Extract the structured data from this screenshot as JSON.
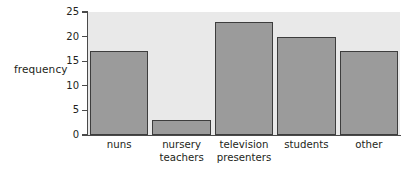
{
  "chart_data": {
    "type": "bar",
    "title": "",
    "xlabel": "",
    "ylabel": "frequency",
    "categories": [
      "nuns",
      "nursery\nteachers",
      "television\npresenters",
      "students",
      "other"
    ],
    "values": [
      17,
      3,
      23,
      20,
      17
    ],
    "ylim": [
      0,
      25
    ],
    "yticks": [
      "0",
      "5",
      "10",
      "15",
      "20",
      "25"
    ],
    "ytick_values": [
      0,
      5,
      10,
      15,
      20,
      25
    ],
    "grid": false,
    "legend": null
  },
  "colors": {
    "bar_fill": "#9b9b9b",
    "bar_edge": "#3d3d3d",
    "plot_background": "#e9e9e9",
    "page_background": "#ffffff",
    "axis": "#4a4a4a",
    "text": "#231f20"
  }
}
